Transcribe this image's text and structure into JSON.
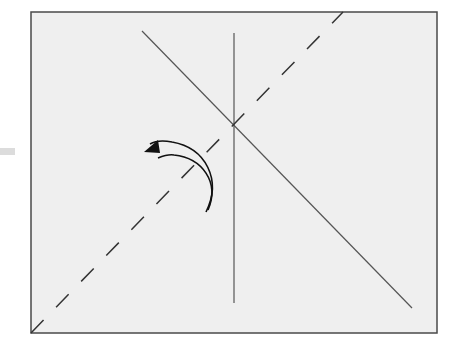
{
  "diagram": {
    "colors": {
      "background": "#ffffff",
      "frame_fill": "#efefef",
      "frame_stroke": "#4a4a4a",
      "line": "#555555",
      "arrow": "#111111",
      "stub": "#dcdcdc"
    },
    "frame": {
      "x": 31,
      "y": 12,
      "width": 406,
      "height": 321
    },
    "lines": {
      "vertical": {
        "x1": 234,
        "y1": 33,
        "x2": 234,
        "y2": 303
      },
      "solid_diagonal": {
        "x1": 142,
        "y1": 31,
        "x2": 412,
        "y2": 308
      },
      "dashed_diagonal": {
        "x1": 31,
        "y1": 333,
        "x2": 343,
        "y2": 12,
        "dash": "18 18"
      }
    },
    "rotation_arrow": {
      "direction": "counter-clockwise",
      "outer_arc": "M 206 212 C 222 180, 206 148, 172 142 C 162 140, 155 141, 150 144",
      "inner_arc": "M 208 210 C 220 182, 202 158, 174 155 C 168 154, 163 156, 158 158",
      "arrowhead": "144,152 158,140 160,153"
    }
  }
}
